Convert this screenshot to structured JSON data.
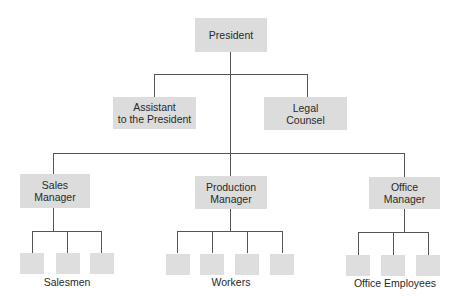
{
  "chart": {
    "top": {
      "label": "President"
    },
    "staff": [
      {
        "line1": "Assistant",
        "line2": "to the President"
      },
      {
        "line1": "Legal",
        "line2": "Counsel"
      }
    ],
    "managers": [
      {
        "line1": "Sales",
        "line2": "Manager",
        "group_label": "Salesmen",
        "subordinate_count": 3
      },
      {
        "line1": "Production",
        "line2": "Manager",
        "group_label": "Workers",
        "subordinate_count": 4
      },
      {
        "line1": "Office",
        "line2": "Manager",
        "group_label": "Office Employees",
        "subordinate_count": 3
      }
    ]
  },
  "colors": {
    "box_fill": "#dcdcdc",
    "line": "#555555",
    "text": "#2a2a2a"
  }
}
